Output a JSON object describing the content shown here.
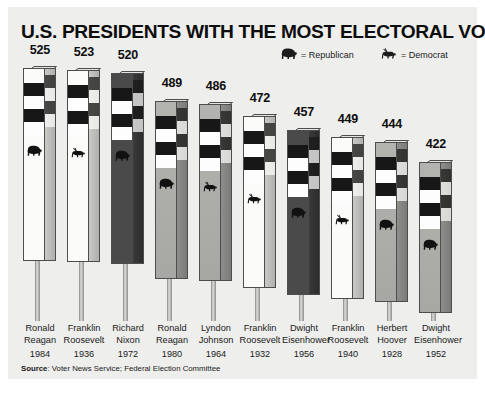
{
  "chart_data": {
    "type": "bar",
    "title": "U.S. PRESIDENTS WITH THE MOST ELECTORAL VOTES",
    "xlabel": "",
    "ylabel": "",
    "ylim": [
      0,
      525
    ],
    "grid": false,
    "legend_position": "top-right",
    "categories": [
      "Ronald Reagan 1984",
      "Franklin Roosevelt 1936",
      "Richard Nixon 1972",
      "Ronald Reagan 1980",
      "Lyndon Johnson 1964",
      "Franklin Roosevelt 1932",
      "Dwight Eisenhower 1956",
      "Franklin Roosevelt 1940",
      "Herbert Hoover 1928",
      "Dwight Eisenhower 1952"
    ],
    "values": [
      525,
      523,
      520,
      489,
      486,
      472,
      457,
      449,
      444,
      422
    ],
    "series": [
      {
        "name": "Electoral votes",
        "values": [
          525,
          523,
          520,
          489,
          486,
          472,
          457,
          449,
          444,
          422
        ]
      }
    ],
    "bars": [
      {
        "value": "525",
        "name_line1": "Ronald",
        "name_line2": "Reagan",
        "year": "1984",
        "party": "Republican",
        "shade": "light"
      },
      {
        "value": "523",
        "name_line1": "Franklin",
        "name_line2": "Roosevelt",
        "year": "1936",
        "party": "Democrat",
        "shade": "light"
      },
      {
        "value": "520",
        "name_line1": "Richard",
        "name_line2": "Nixon",
        "year": "1972",
        "party": "Republican",
        "shade": "dark"
      },
      {
        "value": "489",
        "name_line1": "Ronald",
        "name_line2": "Reagan",
        "year": "1980",
        "party": "Republican",
        "shade": "mid"
      },
      {
        "value": "486",
        "name_line1": "Lyndon",
        "name_line2": "Johnson",
        "year": "1964",
        "party": "Democrat",
        "shade": "mid"
      },
      {
        "value": "472",
        "name_line1": "Franklin",
        "name_line2": "Roosevelt",
        "year": "1932",
        "party": "Democrat",
        "shade": "light"
      },
      {
        "value": "457",
        "name_line1": "Dwight",
        "name_line2": "Eisenhower",
        "year": "1956",
        "party": "Republican",
        "shade": "dark"
      },
      {
        "value": "449",
        "name_line1": "Franklin",
        "name_line2": "Roosevelt",
        "year": "1940",
        "party": "Democrat",
        "shade": "light"
      },
      {
        "value": "444",
        "name_line1": "Herbert",
        "name_line2": "Hoover",
        "year": "1928",
        "party": "Republican",
        "shade": "mid"
      },
      {
        "value": "422",
        "name_line1": "Dwight",
        "name_line2": "Eisenhower",
        "year": "1952",
        "party": "Republican",
        "shade": "mid"
      }
    ],
    "annotations": {
      "bar_style": "3D striped post with party animal icon and thin stem"
    }
  },
  "legend": {
    "republican": {
      "label": "= Republican",
      "icon": "elephant-icon"
    },
    "democrat": {
      "label": "= Democrat",
      "icon": "donkey-icon"
    }
  },
  "source": {
    "prefix": "Source",
    "text": ": Voter News Service; Federal Election Committee"
  },
  "colors": {
    "background": "#eeeeec",
    "text": "#1a1a1a",
    "stripe_dark": "#171717",
    "stripe_light": "#fdfdfd",
    "post_dark": "#4a4a4a",
    "post_mid": "#b3b3b0",
    "post_light": "#fbfbfa"
  }
}
